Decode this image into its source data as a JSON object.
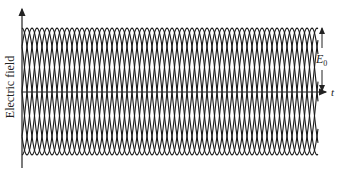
{
  "figure": {
    "title": "",
    "y_axis_label": "Electric field",
    "x_axis_label": "t",
    "amplitude_label": "E",
    "amplitude_subscript": "0",
    "colors": {
      "line": "#1a1a1a",
      "axis": "#222222",
      "background": "#ffffff"
    }
  },
  "chart_data": {
    "type": "line",
    "title": "",
    "xlabel": "t",
    "ylabel": "Electric field",
    "amplitude": "E0",
    "series_count": 8,
    "period_px": 40,
    "phase_offsets_px": [
      0,
      5,
      10,
      15,
      20,
      25,
      30,
      35
    ],
    "envelope_px": {
      "top": 28,
      "center": 92,
      "bottom": 155
    },
    "x_range_px": [
      22,
      318
    ],
    "grid": false
  }
}
